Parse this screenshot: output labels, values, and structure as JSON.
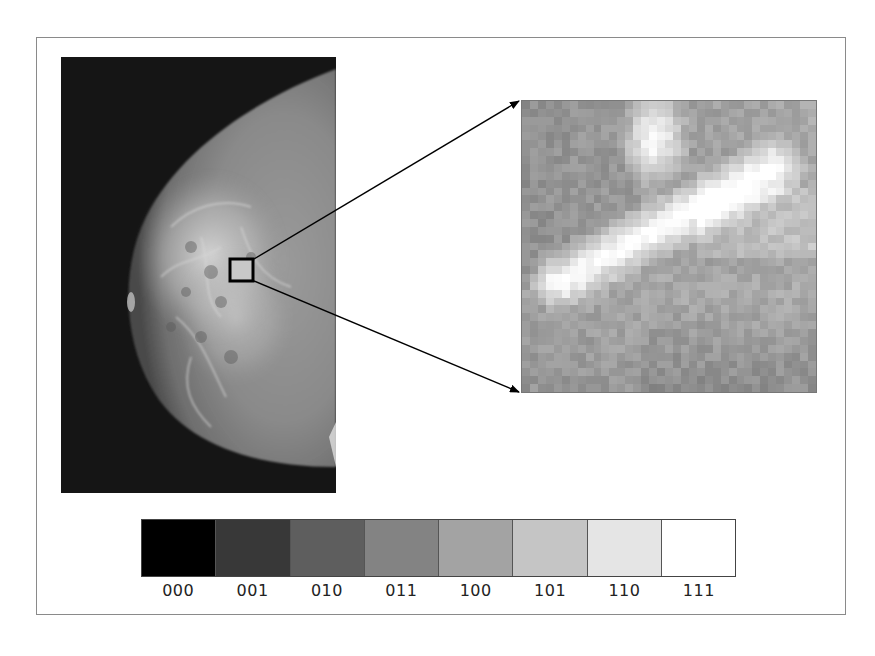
{
  "figure": {
    "mammogram": {
      "region_box": {
        "x": 229,
        "y": 258,
        "width": 25,
        "height": 24
      },
      "label": "mammogram-image"
    },
    "magnified_region": {
      "grid_size": 37,
      "label": "magnified-pixel-region"
    },
    "gray_scale": {
      "levels": [
        {
          "code": "000",
          "color": "#000000"
        },
        {
          "code": "001",
          "color": "#383838"
        },
        {
          "code": "010",
          "color": "#5e5e5e"
        },
        {
          "code": "011",
          "color": "#838383"
        },
        {
          "code": "100",
          "color": "#a3a3a3"
        },
        {
          "code": "101",
          "color": "#c5c5c5"
        },
        {
          "code": "110",
          "color": "#e5e5e5"
        },
        {
          "code": "111",
          "color": "#ffffff"
        }
      ]
    }
  }
}
